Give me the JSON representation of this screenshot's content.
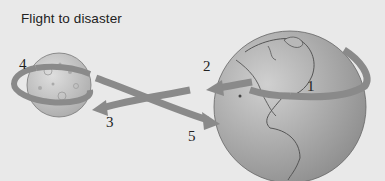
{
  "title": "Flight to disaster",
  "labels": [
    {
      "id": "1",
      "text": "1"
    },
    {
      "id": "2",
      "text": "2"
    },
    {
      "id": "3",
      "text": "3"
    },
    {
      "id": "4",
      "text": "4"
    },
    {
      "id": "5",
      "text": "5"
    }
  ],
  "bodies": {
    "moon": {
      "name": "Moon"
    },
    "earth": {
      "name": "Earth"
    }
  },
  "colors": {
    "background": "#e9e9e9",
    "arrow": "#8a8a8a",
    "earth": "#a9a9a9",
    "moon": "#c4c4c4",
    "outline": "#555555"
  }
}
